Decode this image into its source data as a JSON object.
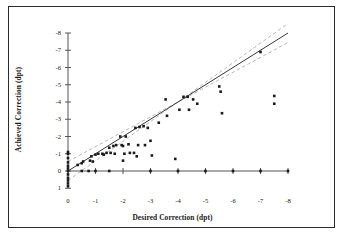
{
  "figure": {
    "background": "#ffffff",
    "frame_color": "#2b2b2b"
  },
  "chart_data": {
    "type": "scatter",
    "title": "",
    "xlabel": "Desired Correction (dpt)",
    "ylabel": "Achieved Correction (dpt)",
    "xlim": [
      0,
      -8
    ],
    "ylim": [
      1,
      -8
    ],
    "grid": false,
    "legend": "none",
    "xticks": [
      "0",
      "-1",
      "-2",
      "-3",
      "-4",
      "-5",
      "-6",
      "-7",
      "-8"
    ],
    "xtick_values": [
      0,
      -1,
      -2,
      -3,
      -4,
      -5,
      -6,
      -7,
      -8
    ],
    "yticks": [
      "1",
      "0",
      "-1",
      "-2",
      "-3",
      "-4",
      "-5",
      "-6",
      "-7",
      "-8"
    ],
    "ytick_values": [
      1,
      0,
      -1,
      -2,
      -3,
      -4,
      -5,
      -6,
      -7,
      -8
    ],
    "marker": {
      "shape": "square",
      "color": "#1a1a1a",
      "size": 2.6
    },
    "reference_lines": [
      {
        "name": "identity-line",
        "style": "solid",
        "color": "#3a3a3a",
        "x": [
          0,
          -8
        ],
        "y": [
          0,
          -8
        ]
      },
      {
        "name": "upper-tolerance-band",
        "style": "dashed",
        "color": "#b9b9b9",
        "x": [
          0,
          -8
        ],
        "y": [
          0.55,
          -8.55
        ],
        "offset": -0.55
      },
      {
        "name": "lower-tolerance-band",
        "style": "dashed",
        "color": "#b9b9b9",
        "x": [
          0,
          -8
        ],
        "y": [
          -0.55,
          -7.45
        ],
        "offset": 0.55
      }
    ],
    "series": [
      {
        "name": "Eyes",
        "points": [
          [
            0.0,
            0.0
          ],
          [
            0.0,
            -0.15
          ],
          [
            0.0,
            -0.3
          ],
          [
            0.0,
            0.2
          ],
          [
            0.0,
            0.4
          ],
          [
            0.0,
            0.55
          ],
          [
            0.0,
            0.72
          ],
          [
            0.0,
            0.88
          ],
          [
            0.0,
            -0.5
          ],
          [
            0.0,
            -0.75
          ],
          [
            0.0,
            -1.0
          ],
          [
            0.0,
            -1.1
          ],
          [
            -0.35,
            -0.35
          ],
          [
            -0.5,
            0.0
          ],
          [
            -0.5,
            -0.45
          ],
          [
            -0.55,
            -0.55
          ],
          [
            -0.75,
            0.0
          ],
          [
            -0.8,
            -0.6
          ],
          [
            -0.85,
            -0.85
          ],
          [
            -0.9,
            -0.55
          ],
          [
            -1.0,
            0.0
          ],
          [
            -1.0,
            -0.95
          ],
          [
            -1.1,
            -1.0
          ],
          [
            -1.25,
            -1.0
          ],
          [
            -1.3,
            -0.95
          ],
          [
            -1.4,
            -1.05
          ],
          [
            -1.5,
            0.0
          ],
          [
            -1.5,
            -1.35
          ],
          [
            -1.55,
            -1.05
          ],
          [
            -1.65,
            -1.45
          ],
          [
            -1.7,
            -1.0
          ],
          [
            -1.75,
            -1.5
          ],
          [
            -1.9,
            -2.0
          ],
          [
            -1.95,
            -1.5
          ],
          [
            -2.0,
            -0.6
          ],
          [
            -2.0,
            -1.45
          ],
          [
            -2.05,
            -1.0
          ],
          [
            -2.1,
            -2.0
          ],
          [
            -2.2,
            -1.55
          ],
          [
            -2.25,
            -1.05
          ],
          [
            -2.4,
            -1.05
          ],
          [
            -2.45,
            -2.5
          ],
          [
            -2.5,
            -0.85
          ],
          [
            -2.55,
            -1.5
          ],
          [
            -2.6,
            -2.55
          ],
          [
            -2.75,
            -2.6
          ],
          [
            -2.8,
            -1.5
          ],
          [
            -2.9,
            -2.5
          ],
          [
            -3.0,
            0.0
          ],
          [
            -3.0,
            -1.75
          ],
          [
            -3.05,
            -0.9
          ],
          [
            -3.3,
            -2.8
          ],
          [
            -3.55,
            -4.15
          ],
          [
            -3.6,
            -3.2
          ],
          [
            -3.9,
            -0.7
          ],
          [
            -4.0,
            0.0
          ],
          [
            -4.05,
            -3.55
          ],
          [
            -4.2,
            -4.3
          ],
          [
            -4.35,
            -4.3
          ],
          [
            -4.4,
            -3.55
          ],
          [
            -4.55,
            -4.15
          ],
          [
            -4.7,
            -3.9
          ],
          [
            -5.0,
            0.0
          ],
          [
            -5.5,
            -4.9
          ],
          [
            -5.55,
            -4.6
          ],
          [
            -5.6,
            -3.35
          ],
          [
            -6.0,
            0.0
          ],
          [
            -7.0,
            -6.9
          ],
          [
            -7.0,
            0.0
          ],
          [
            -7.5,
            -4.35
          ],
          [
            -7.5,
            -3.9
          ],
          [
            -8.0,
            0.0
          ]
        ]
      }
    ]
  }
}
